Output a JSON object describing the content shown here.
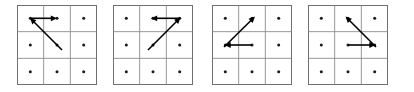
{
  "figure": {
    "title": "Four 3x3 grid panels with directional arrows",
    "background_color": "#ffffff",
    "width": 414,
    "height": 92,
    "panel_count": 4
  },
  "style": {
    "grid_border_color": "#6f6f6f",
    "grid_line_color": "#8c8c8c",
    "dot_color": "#1a1a1a",
    "arrow_color": "#000000",
    "cell_size": 26.67,
    "dot_radius": 1.5
  },
  "grid": {
    "rows": 3,
    "cols": 3,
    "dot_positions": [
      {
        "row": 0,
        "col": 0,
        "x": 13.3,
        "y": 13.3
      },
      {
        "row": 0,
        "col": 1,
        "x": 40.0,
        "y": 13.3
      },
      {
        "row": 0,
        "col": 2,
        "x": 66.7,
        "y": 13.3
      },
      {
        "row": 1,
        "col": 0,
        "x": 13.3,
        "y": 40.0
      },
      {
        "row": 1,
        "col": 1,
        "x": 40.0,
        "y": 40.0
      },
      {
        "row": 1,
        "col": 2,
        "x": 66.7,
        "y": 40.0
      },
      {
        "row": 2,
        "col": 0,
        "x": 13.3,
        "y": 66.7
      },
      {
        "row": 2,
        "col": 1,
        "x": 40.0,
        "y": 66.7
      },
      {
        "row": 2,
        "col": 2,
        "x": 66.7,
        "y": 66.7
      }
    ]
  },
  "panels": [
    {
      "id": "panel-1",
      "label": "Panel 1",
      "left": 17,
      "arrows": [
        {
          "id": "panel-1-horizontal-arrow",
          "name": "horizontal-arrow-right",
          "direction": "right",
          "orientation": "horizontal",
          "from": {
            "x": 14.0,
            "y": 13.3
          },
          "to": {
            "x": 40.0,
            "y": 13.3
          }
        },
        {
          "id": "panel-1-diagonal-arrow",
          "name": "diagonal-arrow-up-left",
          "direction": "up-left",
          "orientation": "diagonal",
          "from": {
            "x": 45.0,
            "y": 45.0
          },
          "to": {
            "x": 13.0,
            "y": 13.0
          }
        }
      ]
    },
    {
      "id": "panel-2",
      "label": "Panel 2",
      "left": 113,
      "arrows": [
        {
          "id": "panel-2-horizontal-arrow",
          "name": "horizontal-arrow-left",
          "direction": "left",
          "orientation": "horizontal",
          "from": {
            "x": 66.0,
            "y": 13.3
          },
          "to": {
            "x": 38.0,
            "y": 13.3
          }
        },
        {
          "id": "panel-2-diagonal-arrow",
          "name": "diagonal-arrow-up-right",
          "direction": "up-right",
          "orientation": "diagonal",
          "from": {
            "x": 35.0,
            "y": 45.0
          },
          "to": {
            "x": 67.5,
            "y": 12.5
          }
        }
      ]
    },
    {
      "id": "panel-3",
      "label": "Panel 3",
      "left": 212,
      "arrows": [
        {
          "id": "panel-3-diagonal-arrow",
          "name": "diagonal-arrow-up-right",
          "direction": "up-right",
          "orientation": "diagonal",
          "from": {
            "x": 12.0,
            "y": 42.0
          },
          "to": {
            "x": 43.0,
            "y": 11.5
          }
        },
        {
          "id": "panel-3-horizontal-arrow",
          "name": "horizontal-arrow-left",
          "direction": "left",
          "orientation": "horizontal",
          "from": {
            "x": 40.0,
            "y": 40.0
          },
          "to": {
            "x": 12.5,
            "y": 40.0
          }
        }
      ]
    },
    {
      "id": "panel-4",
      "label": "Panel 4",
      "left": 308,
      "arrows": [
        {
          "id": "panel-4-diagonal-arrow",
          "name": "diagonal-arrow-up-left",
          "direction": "up-left",
          "orientation": "diagonal",
          "from": {
            "x": 68.0,
            "y": 42.0
          },
          "to": {
            "x": 37.5,
            "y": 11.5
          }
        },
        {
          "id": "panel-4-horizontal-arrow",
          "name": "horizontal-arrow-right",
          "direction": "right",
          "orientation": "horizontal",
          "from": {
            "x": 40.0,
            "y": 40.0
          },
          "to": {
            "x": 67.5,
            "y": 40.0
          }
        }
      ]
    }
  ]
}
